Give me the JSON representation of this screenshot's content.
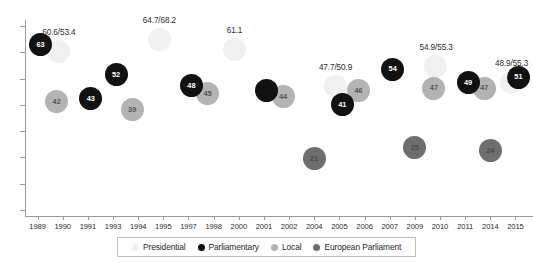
{
  "chart_data": {
    "type": "scatter",
    "title": "",
    "subtitle": "",
    "xlabel": "",
    "ylabel": "",
    "grid": false,
    "legend_position": "bottom",
    "xlim": [
      1988.5,
      2016.5
    ],
    "ylim": [
      0,
      72
    ],
    "x_tick_labels": [
      "1989",
      "1990",
      "1991",
      "1993",
      "1994",
      "1995",
      "1997",
      "1998",
      "2000",
      "2001",
      "2002",
      "2004",
      "2005",
      "2006",
      "2007",
      "2009",
      "2010",
      "2011",
      "2014",
      "2015"
    ],
    "y_tick_count": 8,
    "y_tick_labels": [],
    "series": [
      {
        "name": "Presidential",
        "color": "#f0f0f0",
        "points": [
          {
            "year": "1990",
            "value": 60.6,
            "label": "",
            "annotation": "60.6/53.4"
          },
          {
            "year": "1995",
            "value": 64.7,
            "label": "",
            "annotation": "64.7/68.2"
          },
          {
            "year": "2000",
            "value": 61.1,
            "label": "",
            "annotation": "61.1"
          },
          {
            "year": "2005",
            "value": 47.7,
            "label": "",
            "annotation": "47.7/50.9"
          },
          {
            "year": "2010",
            "value": 54.9,
            "label": "",
            "annotation": "54.9/55.3"
          },
          {
            "year": "2015",
            "value": 48.9,
            "label": "",
            "annotation": "48.9/55.3"
          }
        ]
      },
      {
        "name": "Parliamentary",
        "color": "#111111",
        "points": [
          {
            "year": "1989",
            "value": 63,
            "label": "63",
            "annotation": ""
          },
          {
            "year": "1991",
            "value": 43,
            "label": "43",
            "annotation": ""
          },
          {
            "year": "1993",
            "value": 52,
            "label": "52",
            "annotation": ""
          },
          {
            "year": "1997",
            "value": 48,
            "label": "48",
            "annotation": ""
          },
          {
            "year": "2001",
            "value": 46,
            "label": "",
            "annotation": ""
          },
          {
            "year": "2005",
            "value": 41,
            "label": "41",
            "annotation": ""
          },
          {
            "year": "2007",
            "value": 54,
            "label": "54",
            "annotation": ""
          },
          {
            "year": "2011",
            "value": 49,
            "label": "49",
            "annotation": ""
          },
          {
            "year": "2015",
            "value": 51,
            "label": "51",
            "annotation": ""
          }
        ]
      },
      {
        "name": "Local",
        "color": "#b3b3b3",
        "points": [
          {
            "year": "1990",
            "value": 42,
            "label": "42",
            "annotation": ""
          },
          {
            "year": "1994",
            "value": 39,
            "label": "39",
            "annotation": ""
          },
          {
            "year": "1998",
            "value": 45,
            "label": "45",
            "annotation": ""
          },
          {
            "year": "2002",
            "value": 44,
            "label": "44",
            "annotation": ""
          },
          {
            "year": "2006",
            "value": 46,
            "label": "46",
            "annotation": ""
          },
          {
            "year": "2010",
            "value": 47,
            "label": "47",
            "annotation": ""
          },
          {
            "year": "2014",
            "value": 47,
            "label": "47",
            "annotation": ""
          }
        ]
      },
      {
        "name": "European Parliament",
        "color": "#6e6e6e",
        "points": [
          {
            "year": "2004",
            "value": 21,
            "label": "21",
            "annotation": ""
          },
          {
            "year": "2009",
            "value": 25,
            "label": "25",
            "annotation": ""
          },
          {
            "year": "2014",
            "value": 24,
            "label": "24",
            "annotation": ""
          }
        ]
      }
    ]
  },
  "legend": {
    "items": [
      {
        "label": "Presidential",
        "color": "#f0f0f0"
      },
      {
        "label": "Parliamentary",
        "color": "#111111"
      },
      {
        "label": "Local",
        "color": "#b3b3b3"
      },
      {
        "label": "European Parliament",
        "color": "#6e6e6e"
      }
    ]
  },
  "layout": {
    "plot_left": 25,
    "plot_right": 528,
    "plot_top": 20,
    "plot_bottom": 216,
    "bubble_radius": 11.5
  }
}
